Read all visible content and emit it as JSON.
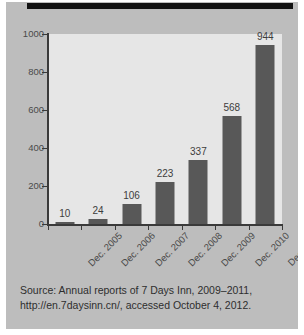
{
  "figure": {
    "background_color": "#bdbdbd",
    "plot_background_color": "#e6e6e6",
    "bar_color": "#585858",
    "axis_color": "#3a3a3a",
    "top_rule": "top-black-rule"
  },
  "chart_data": {
    "type": "bar",
    "title": "",
    "subtitle": "",
    "xlabel": "",
    "ylabel": "",
    "categories": [
      "Dec. 2005",
      "Dec. 2006",
      "Dec. 2007",
      "Dec. 2008",
      "Dec. 2009",
      "Dec. 2010",
      "Dec. 2011"
    ],
    "values": [
      10,
      24,
      106,
      223,
      337,
      568,
      944
    ],
    "data_labels": [
      "10",
      "24",
      "106",
      "223",
      "337",
      "568",
      "944"
    ],
    "ylim": [
      0,
      1000
    ],
    "yticks": [
      0,
      200,
      400,
      600,
      800,
      1000
    ],
    "ytick_labels": [
      "0",
      "200",
      "400",
      "600",
      "800",
      "1000"
    ],
    "grid": false,
    "legend": false,
    "legend_position": "none",
    "bar_color": "#585858",
    "orientation": "vertical"
  },
  "source": {
    "line1": "Source: Annual reports of 7 Days Inn, 2009–2011,",
    "line2": "http://en.7daysinn.cn/, accessed October 4, 2012."
  }
}
